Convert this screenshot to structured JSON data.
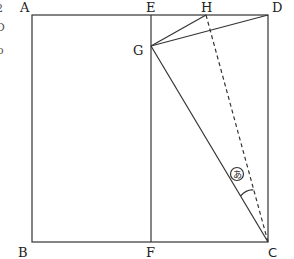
{
  "diagram": {
    "points": {
      "A": {
        "label": "A",
        "x": 32,
        "y": 15
      },
      "E": {
        "label": "E",
        "x": 151,
        "y": 15
      },
      "H": {
        "label": "H",
        "x": 206,
        "y": 15
      },
      "D": {
        "label": "D",
        "x": 268,
        "y": 15
      },
      "G": {
        "label": "G",
        "x": 151,
        "y": 46
      },
      "B": {
        "label": "B",
        "x": 32,
        "y": 242
      },
      "F": {
        "label": "F",
        "x": 151,
        "y": 242
      },
      "C": {
        "label": "C",
        "x": 268,
        "y": 242
      }
    },
    "segments": [
      {
        "from": "A",
        "to": "D",
        "style": "solid"
      },
      {
        "from": "A",
        "to": "B",
        "style": "solid"
      },
      {
        "from": "B",
        "to": "C",
        "style": "solid"
      },
      {
        "from": "D",
        "to": "C",
        "style": "solid"
      },
      {
        "from": "E",
        "to": "F",
        "style": "solid"
      },
      {
        "from": "G",
        "to": "H",
        "style": "solid"
      },
      {
        "from": "G",
        "to": "D",
        "style": "solid"
      },
      {
        "from": "G",
        "to": "C",
        "style": "solid"
      },
      {
        "from": "H",
        "to": "C",
        "style": "dashed"
      }
    ],
    "angle_marker": {
      "label": "あ",
      "vertex": "C",
      "between": [
        "G",
        "H"
      ]
    },
    "edge_artifacts": [
      "2",
      "D",
      "o"
    ]
  }
}
